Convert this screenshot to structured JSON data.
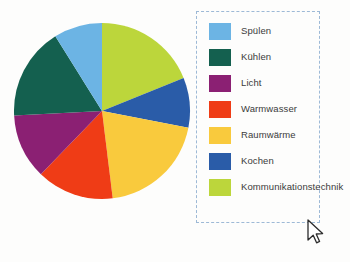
{
  "chart_data": {
    "type": "pie",
    "title": "",
    "legend_position": "right",
    "labels": [
      "Spülen",
      "Kühlen",
      "Licht",
      "Warmwasser",
      "Raumwärme",
      "Kochen",
      "Kommunikationstechnik"
    ],
    "colors": [
      "#6CB4E4",
      "#14604F",
      "#8B2073",
      "#EF3C16",
      "#F9CA3D",
      "#2A5CA8",
      "#BCD63B"
    ],
    "values": [
      9,
      17,
      12,
      14,
      20,
      9,
      19
    ],
    "start_angle_deg": 0,
    "direction": "clockwise",
    "segments": [
      {
        "label": "Kommunikationstechnik",
        "color": "#BCD63B",
        "value": 19,
        "start_deg": 0,
        "end_deg": 68
      },
      {
        "label": "Kochen",
        "color": "#2A5CA8",
        "value": 9,
        "start_deg": 68,
        "end_deg": 101
      },
      {
        "label": "Raumwärme",
        "color": "#F9CA3D",
        "value": 20,
        "start_deg": 101,
        "end_deg": 173
      },
      {
        "label": "Warmwasser",
        "color": "#EF3C16",
        "value": 14,
        "start_deg": 173,
        "end_deg": 224
      },
      {
        "label": "Licht",
        "color": "#8B2073",
        "value": 12,
        "start_deg": 224,
        "end_deg": 267
      },
      {
        "label": "Kühlen",
        "color": "#14604F",
        "value": 17,
        "start_deg": 267,
        "end_deg": 328
      },
      {
        "label": "Spülen",
        "color": "#6CB4E4",
        "value": 9,
        "start_deg": 328,
        "end_deg": 360
      }
    ]
  },
  "legend": {
    "items": [
      {
        "label": "Spülen",
        "color": "#6CB4E4"
      },
      {
        "label": "Kühlen",
        "color": "#14604F"
      },
      {
        "label": "Licht",
        "color": "#8B2073"
      },
      {
        "label": "Warmwasser",
        "color": "#EF3C16"
      },
      {
        "label": "Raumwärme",
        "color": "#F9CA3D"
      },
      {
        "label": "Kochen",
        "color": "#2A5CA8"
      },
      {
        "label": "Kommunikationstechnik",
        "color": "#BCD63B"
      }
    ],
    "border_color": "#9DB9D6"
  },
  "cursor": {
    "icon": "mouse-pointer-icon",
    "x": 306,
    "y": 219
  }
}
